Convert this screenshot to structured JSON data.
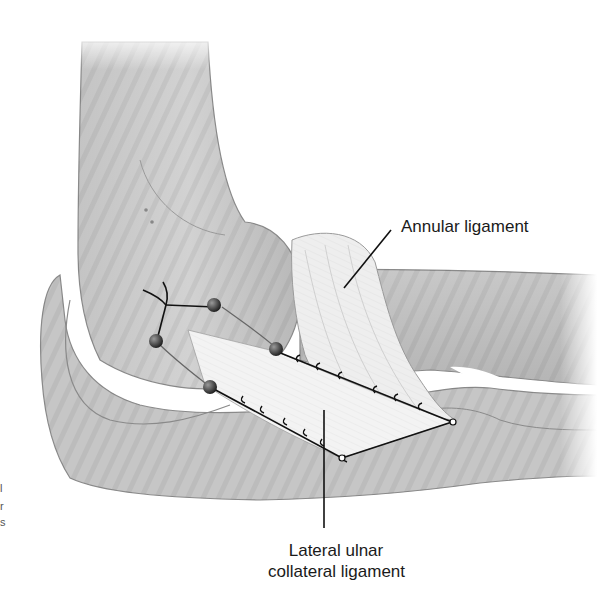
{
  "figure": {
    "labels": {
      "annular_ligament": "Annular ligament",
      "lucl_line1": "Lateral ulnar",
      "lucl_line2": "collateral ligament"
    },
    "edge_fragments": [
      "l",
      "r",
      "s"
    ],
    "colors": {
      "bone_fill": "#c9c9c9",
      "bone_outline": "#8a8a8a",
      "graft_fill": "#f2f2f2",
      "suture": "#111111",
      "background": "#ffffff"
    }
  }
}
